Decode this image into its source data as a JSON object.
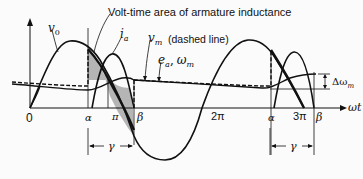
{
  "diagram": {
    "annotation": "Volt-time area of armature inductance",
    "labels": {
      "vo": "v",
      "vo_sub": "0",
      "ia": "i",
      "ia_sub": "a",
      "vm": "v",
      "vm_sub": "m",
      "vm_note": "(dashed line)",
      "ea": "e",
      "ea_sub": "a",
      "ea_sep": ",",
      "wm": "ω",
      "wm_sub": "m",
      "dwm": "Δω",
      "dwm_sub": "m",
      "axis": "ωt"
    },
    "ticks": {
      "zero": "0",
      "alpha1": "α",
      "pi": "π",
      "beta1": "β",
      "two_pi": "2π",
      "alpha2": "α",
      "three_pi": "3π",
      "beta2": "β"
    },
    "gamma": "γ",
    "colors": {
      "line": "#111111",
      "shade": "#b5b5b5",
      "bg": "#fbfbfb"
    }
  }
}
